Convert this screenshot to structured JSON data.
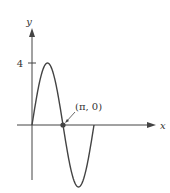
{
  "chart_data": {
    "type": "line",
    "title": "",
    "function": "y = 4 sin(x)",
    "xlabel": "x",
    "ylabel": "y",
    "x_range": [
      0,
      6.2832
    ],
    "ylim": [
      -4,
      4
    ],
    "y_ticks": [
      {
        "value": 4,
        "label": "4"
      }
    ],
    "series": [
      {
        "name": "4 sin x",
        "x": [
          0,
          0.7854,
          1.5708,
          2.3562,
          3.1416,
          3.927,
          4.7124,
          5.4978,
          6.2832
        ],
        "y": [
          0,
          2.83,
          4,
          2.83,
          0,
          -2.83,
          -4,
          -2.83,
          0
        ]
      }
    ],
    "annotations": [
      {
        "label": "(π, 0)",
        "x": 3.1416,
        "y": 0,
        "marker": "dot",
        "arrow": true
      }
    ],
    "grid": false,
    "colors": {
      "curve": "#444444",
      "axis": "#444444",
      "point": "#444444"
    }
  }
}
